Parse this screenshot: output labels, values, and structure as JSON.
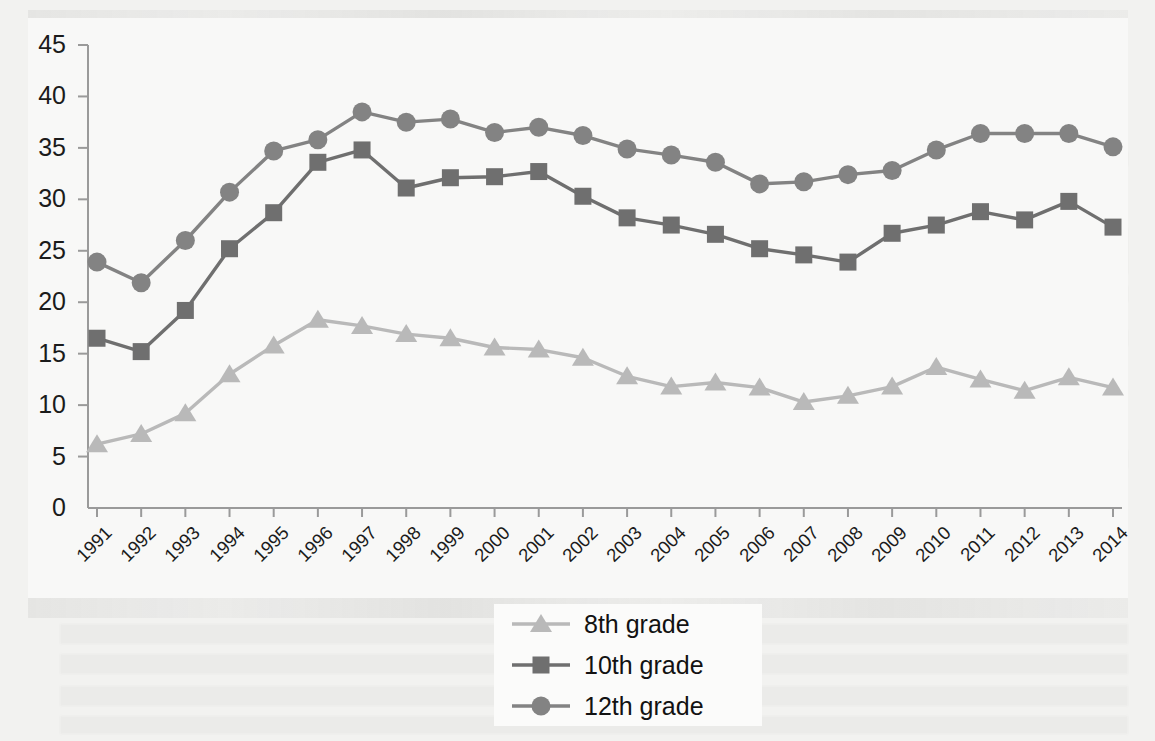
{
  "chart_data": {
    "type": "line",
    "title": "",
    "subtitle": "",
    "xlabel": "",
    "ylabel": "",
    "xlim": [
      1991,
      2014
    ],
    "ylim": [
      0,
      45
    ],
    "ytick_step": 5,
    "grid": false,
    "legend_position": "bottom-center",
    "categories": [
      "1991",
      "1992",
      "1993",
      "1994",
      "1995",
      "1996",
      "1997",
      "1998",
      "1999",
      "2000",
      "2001",
      "2002",
      "2003",
      "2004",
      "2005",
      "2006",
      "2007",
      "2008",
      "2009",
      "2010",
      "2011",
      "2012",
      "2013",
      "2014"
    ],
    "yticks": [
      "0",
      "5",
      "10",
      "15",
      "20",
      "25",
      "30",
      "35",
      "40",
      "45"
    ],
    "series": [
      {
        "name": "8th grade",
        "color": "#b9b9b9",
        "marker": "triangle",
        "values": [
          6.2,
          7.2,
          9.2,
          13.0,
          15.8,
          18.3,
          17.7,
          16.9,
          16.5,
          15.6,
          15.4,
          14.6,
          12.8,
          11.8,
          12.2,
          11.7,
          10.3,
          10.9,
          11.8,
          13.7,
          12.5,
          11.4,
          12.7,
          11.7
        ]
      },
      {
        "name": "10th grade",
        "color": "#6f6f6f",
        "marker": "square",
        "values": [
          16.5,
          15.2,
          19.2,
          25.2,
          28.7,
          33.6,
          34.8,
          31.1,
          32.1,
          32.2,
          32.7,
          30.3,
          28.2,
          27.5,
          26.6,
          25.2,
          24.6,
          23.9,
          26.7,
          27.5,
          28.8,
          28.0,
          29.8,
          27.3
        ]
      },
      {
        "name": "12th grade",
        "color": "#838383",
        "marker": "circle",
        "values": [
          23.9,
          21.9,
          26.0,
          30.7,
          34.7,
          35.8,
          38.5,
          37.5,
          37.8,
          36.5,
          37.0,
          36.2,
          34.9,
          34.3,
          33.6,
          31.5,
          31.7,
          32.4,
          32.8,
          34.8,
          36.4,
          36.4,
          36.4,
          35.1
        ]
      }
    ],
    "legend": [
      {
        "label": "8th grade",
        "marker": "triangle",
        "color": "#b9b9b9"
      },
      {
        "label": "10th grade",
        "marker": "square",
        "color": "#6f6f6f"
      },
      {
        "label": "12th grade",
        "marker": "circle",
        "color": "#838383"
      }
    ]
  },
  "axis": {
    "spine_color": "#9a9a9a",
    "tick_color": "#9a9a9a"
  },
  "figure": {
    "background": "#f6f6f5"
  }
}
